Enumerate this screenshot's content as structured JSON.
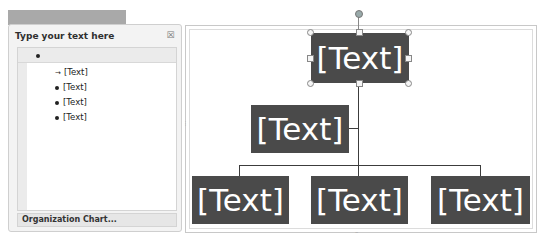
{
  "text_pane": {
    "title": "Type your text here",
    "close_icon": "close-x-icon",
    "items": [
      {
        "level": 0,
        "text": "",
        "marker": "bullet",
        "selected": true
      },
      {
        "level": 1,
        "text": "[Text]",
        "marker": "arrow"
      },
      {
        "level": 1,
        "text": "[Text]",
        "marker": "bullet"
      },
      {
        "level": 1,
        "text": "[Text]",
        "marker": "bullet"
      },
      {
        "level": 1,
        "text": "[Text]",
        "marker": "bullet"
      }
    ],
    "footer": "Organization Chart..."
  },
  "org_chart": {
    "top": "[Text]",
    "assistant": "[Text]",
    "children": [
      "[Text]",
      "[Text]",
      "[Text]"
    ]
  },
  "colors": {
    "node_fill": "#4a4a4a",
    "node_text": "#ffffff",
    "connector": "#3c3c3c"
  }
}
